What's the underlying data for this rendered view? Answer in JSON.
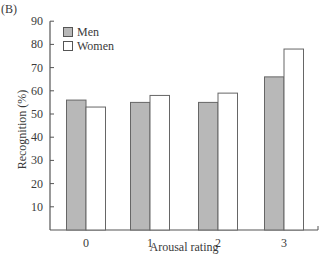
{
  "panel_label": "(B)",
  "legend": [
    {
      "label": "Men",
      "color": "#b8b8b8"
    },
    {
      "label": "Women",
      "color": "#ffffff"
    }
  ],
  "axes": {
    "xlabel": "Arousal rating",
    "ylabel": "Recognition (%)",
    "yticks": [
      10,
      20,
      30,
      40,
      50,
      60,
      70,
      80,
      90
    ],
    "xticks": [
      "0",
      "1",
      "2",
      "3"
    ]
  },
  "chart_data": {
    "type": "bar",
    "title": "",
    "panel": "(B)",
    "xlabel": "Arousal rating",
    "ylabel": "Recognition (%)",
    "categories": [
      "0",
      "1",
      "2",
      "3"
    ],
    "series": [
      {
        "name": "Men",
        "color": "#b8b8b8",
        "values": [
          56,
          55,
          55,
          66
        ]
      },
      {
        "name": "Women",
        "color": "#ffffff",
        "values": [
          53,
          58,
          59,
          78
        ]
      }
    ],
    "ylim": [
      0,
      90
    ],
    "yticks": [
      10,
      20,
      30,
      40,
      50,
      60,
      70,
      80,
      90
    ],
    "grid": false,
    "legend_position": "upper left"
  }
}
